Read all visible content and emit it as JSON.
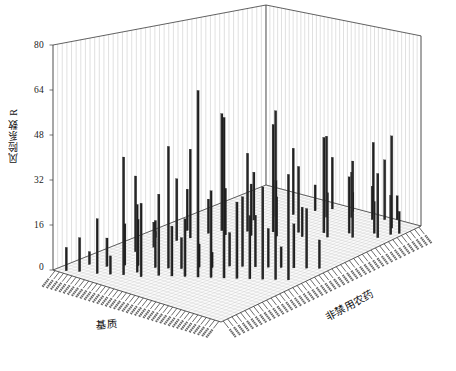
{
  "figure": {
    "type": "3d-bar-chart",
    "background": "#ffffff",
    "bar_color": "#1e1e1e",
    "frame_color": "#3a3a3a",
    "grid_color": "#b9b9b9"
  },
  "axes": {
    "z": {
      "title": "风险系数 R",
      "ticks": [
        "0",
        "16",
        "32",
        "48",
        "64",
        "80"
      ],
      "min": 0,
      "max": 80,
      "tick_step": 16
    },
    "row": {
      "title": "基质",
      "title_en": "matrix",
      "count": 40
    },
    "col": {
      "title": "非禁用农药",
      "title_en": "non-banned pesticide",
      "count": 46
    }
  },
  "chart_data": {
    "type": "bar",
    "title": "",
    "xlabel": "基质",
    "ylabel": "非禁用农药",
    "zlabel": "风险系数 R",
    "zlim": [
      0,
      80
    ],
    "ztick_labels": [
      "0",
      "16",
      "32",
      "48",
      "64",
      "80"
    ],
    "grid": true,
    "legend": "none",
    "note": "3D bar field: each bar is (row=基质 index, col=非禁用农药 index, height=风险系数 R)",
    "bars": [
      {
        "r": 2,
        "c": 1,
        "v": 9
      },
      {
        "r": 4,
        "c": 2,
        "v": 13
      },
      {
        "r": 3,
        "c": 5,
        "v": 5
      },
      {
        "r": 7,
        "c": 3,
        "v": 21
      },
      {
        "r": 6,
        "c": 6,
        "v": 11
      },
      {
        "r": 9,
        "c": 4,
        "v": 7
      },
      {
        "r": 8,
        "c": 8,
        "v": 16
      },
      {
        "r": 11,
        "c": 5,
        "v": 45
      },
      {
        "r": 10,
        "c": 9,
        "v": 18
      },
      {
        "r": 12,
        "c": 7,
        "v": 26
      },
      {
        "r": 13,
        "c": 10,
        "v": 14
      },
      {
        "r": 14,
        "c": 6,
        "v": 28
      },
      {
        "r": 15,
        "c": 11,
        "v": 47
      },
      {
        "r": 16,
        "c": 8,
        "v": 31
      },
      {
        "r": 17,
        "c": 12,
        "v": 12
      },
      {
        "r": 18,
        "c": 9,
        "v": 19
      },
      {
        "r": 19,
        "c": 14,
        "v": 9
      },
      {
        "r": 20,
        "c": 10,
        "v": 22
      },
      {
        "r": 21,
        "c": 15,
        "v": 6
      },
      {
        "r": 22,
        "c": 11,
        "v": 71
      },
      {
        "r": 23,
        "c": 17,
        "v": 13
      },
      {
        "r": 24,
        "c": 12,
        "v": 33
      },
      {
        "r": 25,
        "c": 18,
        "v": 27
      },
      {
        "r": 26,
        "c": 13,
        "v": 61
      },
      {
        "r": 27,
        "c": 19,
        "v": 20
      },
      {
        "r": 28,
        "c": 14,
        "v": 29
      },
      {
        "r": 29,
        "c": 20,
        "v": 15
      },
      {
        "r": 30,
        "c": 15,
        "v": 24
      },
      {
        "r": 31,
        "c": 21,
        "v": 8
      },
      {
        "r": 32,
        "c": 16,
        "v": 35
      },
      {
        "r": 33,
        "c": 22,
        "v": 17
      },
      {
        "r": 34,
        "c": 17,
        "v": 64
      },
      {
        "r": 35,
        "c": 23,
        "v": 23
      },
      {
        "r": 36,
        "c": 18,
        "v": 40
      },
      {
        "r": 37,
        "c": 24,
        "v": 11
      },
      {
        "r": 5,
        "c": 13,
        "v": 30
      },
      {
        "r": 6,
        "c": 16,
        "v": 10
      },
      {
        "r": 7,
        "c": 20,
        "v": 25
      },
      {
        "r": 8,
        "c": 22,
        "v": 36
      },
      {
        "r": 9,
        "c": 25,
        "v": 14
      },
      {
        "r": 10,
        "c": 27,
        "v": 48
      },
      {
        "r": 12,
        "c": 26,
        "v": 19
      },
      {
        "r": 14,
        "c": 29,
        "v": 32
      },
      {
        "r": 16,
        "c": 28,
        "v": 21
      },
      {
        "r": 18,
        "c": 31,
        "v": 44
      },
      {
        "r": 20,
        "c": 30,
        "v": 16
      },
      {
        "r": 22,
        "c": 33,
        "v": 27
      },
      {
        "r": 24,
        "c": 32,
        "v": 12
      },
      {
        "r": 26,
        "c": 35,
        "v": 39
      },
      {
        "r": 28,
        "c": 34,
        "v": 18
      },
      {
        "r": 30,
        "c": 37,
        "v": 23
      },
      {
        "r": 32,
        "c": 36,
        "v": 31
      },
      {
        "r": 34,
        "c": 39,
        "v": 13
      },
      {
        "r": 36,
        "c": 38,
        "v": 26
      },
      {
        "r": 38,
        "c": 41,
        "v": 9
      },
      {
        "r": 3,
        "c": 19,
        "v": 7
      },
      {
        "r": 5,
        "c": 24,
        "v": 17
      },
      {
        "r": 11,
        "c": 33,
        "v": 20
      },
      {
        "r": 13,
        "c": 36,
        "v": 15
      },
      {
        "r": 15,
        "c": 38,
        "v": 28
      },
      {
        "r": 17,
        "c": 41,
        "v": 11
      },
      {
        "r": 19,
        "c": 43,
        "v": 22
      },
      {
        "r": 21,
        "c": 40,
        "v": 34
      },
      {
        "r": 23,
        "c": 44,
        "v": 8
      },
      {
        "r": 25,
        "c": 42,
        "v": 19
      },
      {
        "r": 27,
        "c": 45,
        "v": 30
      },
      {
        "r": 29,
        "c": 43,
        "v": 14
      },
      {
        "r": 31,
        "c": 44,
        "v": 25
      },
      {
        "r": 33,
        "c": 45,
        "v": 10
      },
      {
        "r": 35,
        "c": 42,
        "v": 38
      },
      {
        "r": 37,
        "c": 40,
        "v": 16
      }
    ]
  }
}
